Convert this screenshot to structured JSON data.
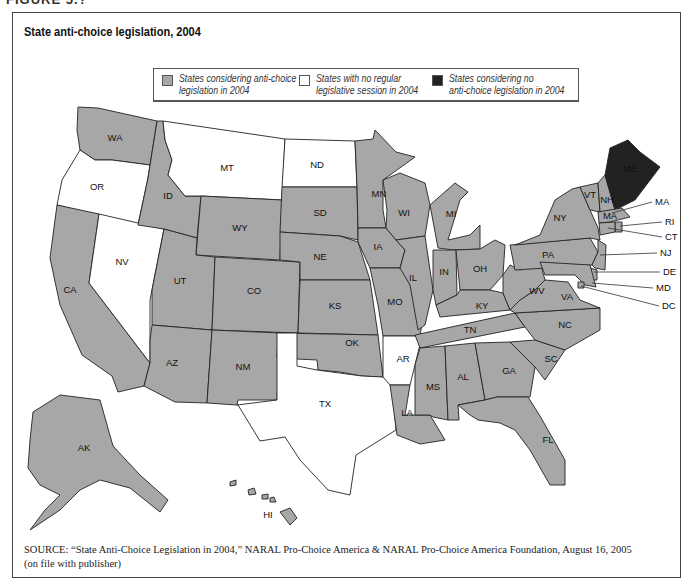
{
  "figure": {
    "label": "FIGURE 5.?",
    "title": "State anti-choice legislation, 2004"
  },
  "colors": {
    "considering": "#a7a7a7",
    "no_session": "#ffffff",
    "none": "#222222",
    "border": "#222222"
  },
  "legend": [
    {
      "key": "considering",
      "label_line1": "States considering anti-choice",
      "label_line2": "legislation in 2004"
    },
    {
      "key": "no_session",
      "label_line1": "States with no regular",
      "label_line2": "legislative session in 2004"
    },
    {
      "key": "none",
      "label_line1": "States considering no",
      "label_line2": "anti-choice legislation in 2004"
    }
  ],
  "source": {
    "prefix": "SOURCE:",
    "line1": " “State Anti-Choice Legislation in 2004,” NARAL Pro-Choice America & NARAL Pro-Choice America Foundation, August 16, 2005",
    "line2": "(on file with publisher)"
  },
  "states": {
    "considering": [
      "WA",
      "ID",
      "WY",
      "UT",
      "CO",
      "AZ",
      "NM",
      "CA",
      "AK",
      "HI",
      "SD",
      "NE",
      "KS",
      "OK",
      "MN",
      "IA",
      "MO",
      "WI",
      "IL",
      "MI",
      "IN",
      "OH",
      "KY",
      "TN",
      "MS",
      "AL",
      "LA",
      "GA",
      "FL",
      "SC",
      "NC",
      "VA",
      "WV",
      "PA",
      "NY",
      "VT",
      "NH",
      "MA",
      "RI",
      "CT",
      "NJ",
      "DE",
      "MD",
      "DC"
    ],
    "no_session": [
      "OR",
      "NV",
      "MT",
      "ND",
      "TX",
      "AR"
    ],
    "none": [
      "ME"
    ]
  },
  "callouts": [
    "MA",
    "RI",
    "CT",
    "NJ",
    "DE",
    "MD",
    "DC"
  ],
  "chart_data": {
    "type": "choropleth",
    "title": "State anti-choice legislation, 2004",
    "categories": [
      "States considering anti-choice legislation in 2004",
      "States with no regular legislative session in 2004",
      "States considering no anti-choice legislation in 2004"
    ],
    "values": {
      "States considering anti-choice legislation in 2004": [
        "WA",
        "ID",
        "WY",
        "UT",
        "CO",
        "AZ",
        "NM",
        "CA",
        "AK",
        "HI",
        "SD",
        "NE",
        "KS",
        "OK",
        "MN",
        "IA",
        "MO",
        "WI",
        "IL",
        "MI",
        "IN",
        "OH",
        "KY",
        "TN",
        "MS",
        "AL",
        "LA",
        "GA",
        "FL",
        "SC",
        "NC",
        "VA",
        "WV",
        "PA",
        "NY",
        "VT",
        "NH",
        "MA",
        "RI",
        "CT",
        "NJ",
        "DE",
        "MD",
        "DC"
      ],
      "States with no regular legislative session in 2004": [
        "OR",
        "NV",
        "MT",
        "ND",
        "TX",
        "AR"
      ],
      "States considering no anti-choice legislation in 2004": [
        "ME"
      ]
    },
    "counts": [
      44,
      6,
      1
    ]
  }
}
